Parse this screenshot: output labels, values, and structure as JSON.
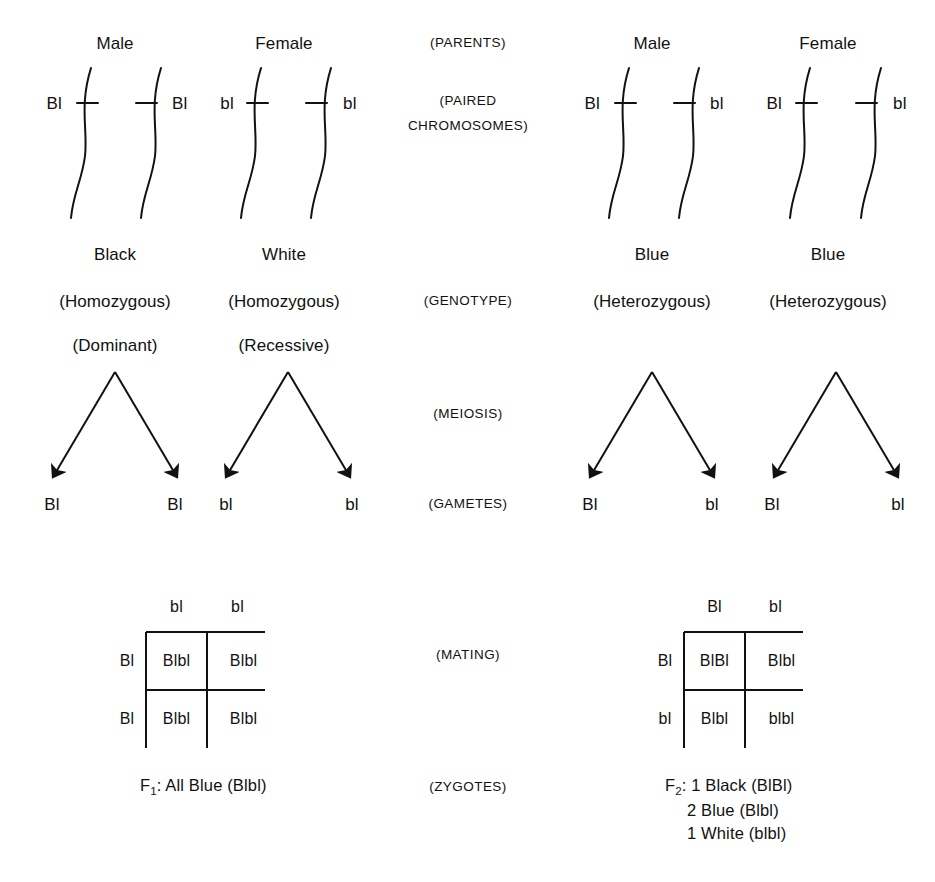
{
  "figure": {
    "ink_color": "#111111",
    "background_color": "#ffffff"
  },
  "stage_labels": [
    {
      "id": "parents",
      "text": "(PARENTS)",
      "x": 468,
      "y": 43
    },
    {
      "id": "paired1",
      "text": "(PAIRED",
      "x": 468,
      "y": 101
    },
    {
      "id": "paired2",
      "text": "CHROMOSOMES)",
      "x": 468,
      "y": 126
    },
    {
      "id": "genotype",
      "text": "(GENOTYPE)",
      "x": 468,
      "y": 301
    },
    {
      "id": "meiosis",
      "text": "(MEIOSIS)",
      "x": 468,
      "y": 414
    },
    {
      "id": "gametes",
      "text": "(GAMETES)",
      "x": 468,
      "y": 504
    },
    {
      "id": "mating",
      "text": "(MATING)",
      "x": 468,
      "y": 655
    },
    {
      "id": "zygotes",
      "text": "(ZYGOTES)",
      "x": 468,
      "y": 787
    }
  ],
  "crosses": [
    {
      "id": "p-cross",
      "name": "Parental cross: Black x White",
      "parents": [
        {
          "id": "p-male",
          "sex_label": "Male",
          "sex_x": 115,
          "phenotype": "Black",
          "zygosity": "(Homozygous)",
          "dominance": "(Dominant)",
          "phenotype_x": 115,
          "chromosomes": [
            {
              "allele": "Bl",
              "allele_x": 62,
              "allele_anchor": "right",
              "axis_x": 82,
              "tick_dir": "right"
            },
            {
              "allele": "Bl",
              "allele_x": 172,
              "allele_anchor": "left",
              "axis_x": 152,
              "tick_dir": "left"
            }
          ],
          "gametes": [
            {
              "allele": "Bl",
              "x": 52
            },
            {
              "allele": "Bl",
              "x": 175
            }
          ],
          "meiosis_apex_x": 115
        },
        {
          "id": "p-female",
          "sex_label": "Female",
          "sex_x": 284,
          "phenotype": "White",
          "zygosity": "(Homozygous)",
          "dominance": "(Recessive)",
          "phenotype_x": 284,
          "chromosomes": [
            {
              "allele": "bl",
              "allele_x": 234,
              "allele_anchor": "right",
              "axis_x": 252,
              "tick_dir": "right"
            },
            {
              "allele": "bl",
              "allele_x": 343,
              "allele_anchor": "left",
              "axis_x": 322,
              "tick_dir": "left"
            }
          ],
          "gametes": [
            {
              "allele": "bl",
              "x": 226
            },
            {
              "allele": "bl",
              "x": 352
            }
          ],
          "meiosis_apex_x": 288
        }
      ]
    },
    {
      "id": "f1-cross",
      "name": "F1 cross: Blue x Blue",
      "parents": [
        {
          "id": "f1-male",
          "sex_label": "Male",
          "sex_x": 652,
          "phenotype": "Blue",
          "zygosity": "(Heterozygous)",
          "dominance": "",
          "phenotype_x": 652,
          "chromosomes": [
            {
              "allele": "Bl",
              "allele_x": 600,
              "allele_anchor": "right",
              "axis_x": 620,
              "tick_dir": "right"
            },
            {
              "allele": "bl",
              "allele_x": 710,
              "allele_anchor": "left",
              "axis_x": 690,
              "tick_dir": "left"
            }
          ],
          "gametes": [
            {
              "allele": "Bl",
              "x": 590
            },
            {
              "allele": "bl",
              "x": 712
            }
          ],
          "meiosis_apex_x": 652
        },
        {
          "id": "f1-female",
          "sex_label": "Female",
          "sex_x": 828,
          "phenotype": "Blue",
          "zygosity": "(Heterozygous)",
          "dominance": "",
          "phenotype_x": 828,
          "chromosomes": [
            {
              "allele": "Bl",
              "allele_x": 782,
              "allele_anchor": "right",
              "axis_x": 801,
              "tick_dir": "right"
            },
            {
              "allele": "bl",
              "allele_x": 893,
              "allele_anchor": "left",
              "axis_x": 872,
              "tick_dir": "left"
            }
          ],
          "gametes": [
            {
              "allele": "Bl",
              "x": 772
            },
            {
              "allele": "bl",
              "x": 898
            }
          ],
          "meiosis_apex_x": 836
        }
      ]
    }
  ],
  "punnett_squares": [
    {
      "id": "f1-punnett",
      "name": "Parental mating Punnett square",
      "origin_x": 146,
      "origin_y": 632,
      "col_width": 61,
      "row_height": 58,
      "top_headers": [
        {
          "text": "bl",
          "col": 0
        },
        {
          "text": "bl",
          "col": 1
        }
      ],
      "side_headers": [
        {
          "text": "Bl",
          "row": 0
        },
        {
          "text": "Bl",
          "row": 1
        }
      ],
      "cells": [
        [
          "Blbl",
          "Blbl"
        ],
        [
          "Blbl",
          "Blbl"
        ]
      ]
    },
    {
      "id": "f2-punnett",
      "name": "F1 mating Punnett square",
      "origin_x": 684,
      "origin_y": 632,
      "col_width": 61,
      "row_height": 58,
      "top_headers": [
        {
          "text": "Bl",
          "col": 0
        },
        {
          "text": "bl",
          "col": 1
        }
      ],
      "side_headers": [
        {
          "text": "Bl",
          "row": 0
        },
        {
          "text": "bl",
          "row": 1
        }
      ],
      "cells": [
        [
          "BlBl",
          "Blbl"
        ],
        [
          "Blbl",
          "blbl"
        ]
      ]
    }
  ],
  "results": {
    "f1": {
      "id": "f1-result",
      "x": 140,
      "y": 787,
      "lines": [
        {
          "prefix": "F",
          "sub": "1",
          "text": ": All Blue (Blbl)"
        }
      ]
    },
    "f2": {
      "id": "f2-result",
      "x": 665,
      "y": 787,
      "lines": [
        {
          "prefix": "F",
          "sub": "2",
          "text": ": 1 Black (BlBl)"
        },
        {
          "prefix": "",
          "sub": "",
          "text": "2 Blue (Blbl)",
          "indent": 22
        },
        {
          "prefix": "",
          "sub": "",
          "text": "1 White (blbl)",
          "indent": 22
        }
      ]
    }
  },
  "geometry": {
    "sex_row_y": 43,
    "chromosome_top_y": 68,
    "chromosome_tick_y": 103,
    "chromosome_bottom_y": 218,
    "phenotype_row_y": 254,
    "zygosity_row_y": 301,
    "dominance_row_y": 345,
    "meiosis_apex_y": 372,
    "meiosis_arrow_tip_y": 477,
    "meiosis_arrow_spread": 62,
    "gamete_row_y": 504,
    "punnett_header_y": 607,
    "stroke_width": 2
  }
}
